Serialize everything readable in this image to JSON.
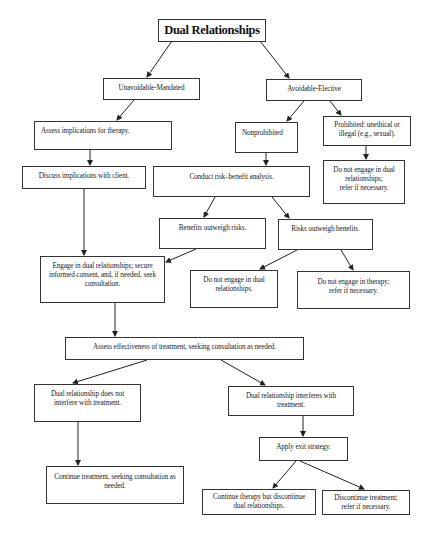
{
  "diagram": {
    "title": "Dual Relationships",
    "nodes": {
      "unavoidable": "Unavoidable-Mandated",
      "avoidable": "Avoidable-Elective",
      "assess_implications": "Assess implications for therapy.",
      "nonprohibited": "Nonprohibited",
      "prohibited_l1": "Prohibited: unethical or",
      "prohibited_l2": "illegal (e.g., sexual).",
      "discuss": "Discuss implications with client.",
      "conduct": "Conduct risk–benefit analysis.",
      "no_dual_right_l1": "Do not engage in dual",
      "no_dual_right_l2": "relationships;",
      "no_dual_right_l3": "refer if necessary.",
      "benefits": "Benefits outweigh risks.",
      "risks": "Risks outweigh benefits.",
      "engage_l1": "Engage in dual relationships; secure",
      "engage_l2": "informed consent, and, if needed, seek",
      "engage_l3": "consultation.",
      "no_dual_mid_l1": "Do not engage in dual",
      "no_dual_mid_l2": "relationships.",
      "no_therapy_l1": "Do not engage in therapy;",
      "no_therapy_l2": "refer if necessary.",
      "assess_effectiveness": "Assess effectiveness of treatment, seeking consultation as needed.",
      "not_interfere_l1": "Dual relationship does not",
      "not_interfere_l2": "interfere with treatment.",
      "interferes_l1": "Dual relationship interferes with",
      "interferes_l2": "treatment.",
      "exit": "Apply exit strategy.",
      "continue_treatment_l1": "Continue treatment, seeking consultation as",
      "continue_treatment_l2": "needed.",
      "continue_therapy_l1": "Continue therapy but discontinue",
      "continue_therapy_l2": "dual relationships.",
      "discontinue_l1": "Discontinue treatment;",
      "discontinue_l2": "refer if necessary."
    },
    "edges": [
      [
        "title",
        "unavoidable"
      ],
      [
        "title",
        "avoidable"
      ],
      [
        "unavoidable",
        "assess_implications"
      ],
      [
        "avoidable",
        "nonprohibited"
      ],
      [
        "avoidable",
        "prohibited"
      ],
      [
        "assess_implications",
        "discuss"
      ],
      [
        "nonprohibited",
        "conduct"
      ],
      [
        "prohibited",
        "no_dual_right"
      ],
      [
        "conduct",
        "benefits"
      ],
      [
        "conduct",
        "risks"
      ],
      [
        "discuss",
        "engage"
      ],
      [
        "benefits",
        "engage"
      ],
      [
        "risks",
        "no_dual_mid"
      ],
      [
        "risks",
        "no_therapy"
      ],
      [
        "engage",
        "assess_effectiveness"
      ],
      [
        "assess_effectiveness",
        "not_interfere"
      ],
      [
        "assess_effectiveness",
        "interferes"
      ],
      [
        "not_interfere",
        "continue_treatment"
      ],
      [
        "interferes",
        "exit"
      ],
      [
        "exit",
        "continue_therapy"
      ],
      [
        "exit",
        "discontinue"
      ]
    ]
  }
}
